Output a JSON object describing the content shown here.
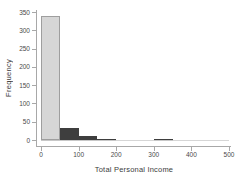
{
  "chart_data": {
    "type": "bar",
    "subtype": "histogram",
    "title": "",
    "xlabel": "Total Personal Income",
    "ylabel": "Frequency",
    "xlim": [
      0,
      500
    ],
    "ylim": [
      0,
      350
    ],
    "grid": false,
    "legend": "none",
    "bin_width": 50,
    "bins": [
      {
        "start": 0,
        "end": 50,
        "count": 340,
        "emphasis": false
      },
      {
        "start": 50,
        "end": 100,
        "count": 33,
        "emphasis": true
      },
      {
        "start": 100,
        "end": 150,
        "count": 12,
        "emphasis": true
      },
      {
        "start": 150,
        "end": 200,
        "count": 3,
        "emphasis": true
      },
      {
        "start": 200,
        "end": 250,
        "count": 1,
        "emphasis": false
      },
      {
        "start": 250,
        "end": 300,
        "count": 1,
        "emphasis": false
      },
      {
        "start": 300,
        "end": 350,
        "count": 2,
        "emphasis": true
      },
      {
        "start": 350,
        "end": 400,
        "count": 1,
        "emphasis": false
      },
      {
        "start": 400,
        "end": 450,
        "count": 1,
        "emphasis": false
      },
      {
        "start": 450,
        "end": 500,
        "count": 1,
        "emphasis": false
      }
    ],
    "x_ticks": [
      0,
      100,
      200,
      300,
      400,
      500
    ],
    "y_ticks": [
      0,
      50,
      100,
      150,
      200,
      250,
      300,
      350
    ],
    "colors": {
      "base_bar_fill": "#d6d6d6",
      "base_bar_border": "#9e9e9e",
      "emphasis_bar_fill": "#3e3e3e",
      "emphasis_bar_border": "#3e3e3e",
      "axis": "#a8a8a8",
      "tick_text": "#4a4a4a",
      "label_text": "#3c3c3c",
      "background": "#ffffff"
    }
  }
}
